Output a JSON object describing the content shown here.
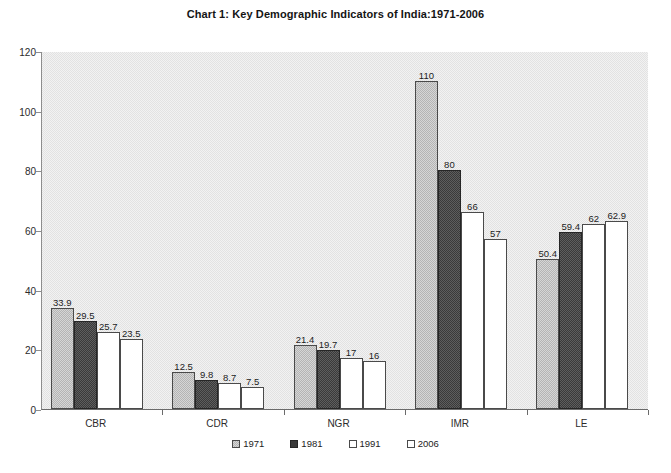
{
  "chart_data": {
    "type": "bar",
    "title": "Chart 1: Key Demographic Indicators of India:1971-2006",
    "xlabel": "",
    "ylabel": "",
    "ylim": [
      0,
      120
    ],
    "yticks": [
      0,
      20,
      40,
      60,
      80,
      100,
      120
    ],
    "grid": false,
    "legend_position": "bottom",
    "categories": [
      "CBR",
      "CDR",
      "NGR",
      "IMR",
      "LE"
    ],
    "series": [
      {
        "name": "1971",
        "values": [
          33.9,
          12.5,
          21.4,
          110,
          50.4
        ],
        "labels": [
          "33.9",
          "12.5",
          "21.4",
          "110",
          "50.4"
        ]
      },
      {
        "name": "1981",
        "values": [
          29.5,
          9.8,
          19.7,
          80,
          59.4
        ],
        "labels": [
          "29.5",
          "9.8",
          "19.7",
          "80",
          "59.4"
        ]
      },
      {
        "name": "1991",
        "values": [
          25.7,
          8.7,
          17,
          66,
          62
        ],
        "labels": [
          "25.7",
          "8.7",
          "17",
          "66",
          "62"
        ]
      },
      {
        "name": "2006",
        "values": [
          23.5,
          7.5,
          16,
          57,
          62.9
        ],
        "labels": [
          "23.5",
          "7.5",
          "16",
          "57",
          "62.9"
        ]
      }
    ]
  },
  "colors": {
    "series_1971": "#b4b4b4",
    "series_1981": "#3a3a3a",
    "series_1991": "#ffffff",
    "series_2006": "#ffffff",
    "plot_background": "#e2e2e2",
    "axis": "#6b6b6b",
    "text": "#1c1c1c"
  }
}
